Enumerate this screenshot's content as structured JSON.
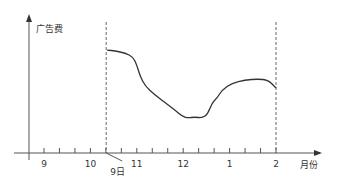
{
  "chart_data": {
    "type": "line",
    "title": "",
    "xlabel": "月份",
    "ylabel": "广告费",
    "x_tick_labels": [
      "9",
      "10",
      "11",
      "12",
      "1",
      "2"
    ],
    "x_unit": "month position (9 = 0 ... 2 = 5)",
    "y_unit": "relative advertising spend (normalized 0-1, 1 = peak; not read from a y-axis scale)",
    "xlim": [
      0,
      5.8
    ],
    "ylim": [
      0,
      1
    ],
    "minor_ticks_per_month": 3,
    "grid": false,
    "annotations": [
      {
        "label": "9日",
        "x": 1.34,
        "style": "dashed"
      },
      {
        "label": "",
        "x": 5.0,
        "style": "dashed"
      }
    ],
    "series": [
      {
        "name": "广告费",
        "color": "#333333",
        "points": [
          [
            1.36,
            0.786
          ],
          [
            1.53,
            0.779
          ],
          [
            1.75,
            0.763
          ],
          [
            1.92,
            0.733
          ],
          [
            2.0,
            0.672
          ],
          [
            2.07,
            0.588
          ],
          [
            2.18,
            0.511
          ],
          [
            2.39,
            0.443
          ],
          [
            2.65,
            0.374
          ],
          [
            2.82,
            0.328
          ],
          [
            2.97,
            0.282
          ],
          [
            3.1,
            0.267
          ],
          [
            3.25,
            0.275
          ],
          [
            3.41,
            0.267
          ],
          [
            3.53,
            0.298
          ],
          [
            3.62,
            0.382
          ],
          [
            3.73,
            0.42
          ],
          [
            3.84,
            0.481
          ],
          [
            4.05,
            0.534
          ],
          [
            4.33,
            0.557
          ],
          [
            4.61,
            0.565
          ],
          [
            4.83,
            0.557
          ],
          [
            5.0,
            0.496
          ]
        ]
      }
    ]
  }
}
